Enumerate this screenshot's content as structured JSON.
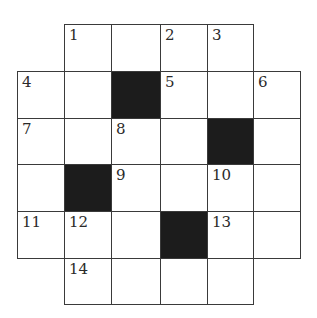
{
  "puzzle": {
    "type": "crossword",
    "rows": 6,
    "cols": 6,
    "colors": {
      "line": "#3a3a3a",
      "block": "#1c1c1c",
      "cell": "#ffffff",
      "number": "#2a2a2a"
    },
    "grid": [
      [
        null,
        {
          "n": "1"
        },
        {
          "n": ""
        },
        {
          "n": "2"
        },
        {
          "n": "3"
        },
        null
      ],
      [
        {
          "n": "4"
        },
        {
          "n": ""
        },
        {
          "black": true
        },
        {
          "n": "5"
        },
        {
          "n": ""
        },
        {
          "n": "6"
        }
      ],
      [
        {
          "n": "7"
        },
        {
          "n": ""
        },
        {
          "n": "8"
        },
        {
          "n": ""
        },
        {
          "black": true
        },
        {
          "n": ""
        }
      ],
      [
        {
          "n": ""
        },
        {
          "black": true
        },
        {
          "n": "9"
        },
        {
          "n": ""
        },
        {
          "n": "10"
        },
        {
          "n": ""
        }
      ],
      [
        {
          "n": "11"
        },
        {
          "n": "12"
        },
        {
          "n": ""
        },
        {
          "black": true
        },
        {
          "n": "13"
        },
        {
          "n": ""
        }
      ],
      [
        null,
        {
          "n": "14"
        },
        {
          "n": ""
        },
        {
          "n": ""
        },
        {
          "n": ""
        },
        null
      ]
    ]
  }
}
